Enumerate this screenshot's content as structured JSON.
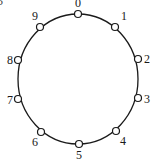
{
  "figure": {
    "corner_fragment": "5",
    "ring": {
      "cx": 78,
      "cy": 79,
      "rx": 60,
      "ry": 65,
      "stroke": "#1a1a1a"
    },
    "nodes": [
      {
        "label": "0",
        "x": 78,
        "y": 14,
        "lx": 78,
        "ly": 7,
        "anchor": "middle"
      },
      {
        "label": "1",
        "x": 115,
        "y": 27,
        "lx": 121,
        "ly": 20,
        "anchor": "start"
      },
      {
        "label": "2",
        "x": 138,
        "y": 59,
        "lx": 144,
        "ly": 63,
        "anchor": "start"
      },
      {
        "label": "3",
        "x": 138,
        "y": 98,
        "lx": 144,
        "ly": 103,
        "anchor": "start"
      },
      {
        "label": "4",
        "x": 116,
        "y": 131,
        "lx": 120,
        "ly": 145,
        "anchor": "start"
      },
      {
        "label": "5",
        "x": 79,
        "y": 144,
        "lx": 79,
        "ly": 159,
        "anchor": "middle"
      },
      {
        "label": "6",
        "x": 41,
        "y": 132,
        "lx": 35,
        "ly": 146,
        "anchor": "middle"
      },
      {
        "label": "7",
        "x": 18,
        "y": 99,
        "lx": 10,
        "ly": 104,
        "anchor": "middle"
      },
      {
        "label": "8",
        "x": 18,
        "y": 60,
        "lx": 10,
        "ly": 64,
        "anchor": "middle"
      },
      {
        "label": "9",
        "x": 40,
        "y": 27,
        "lx": 35,
        "ly": 20,
        "anchor": "middle"
      }
    ],
    "node_radius": 3.5
  }
}
